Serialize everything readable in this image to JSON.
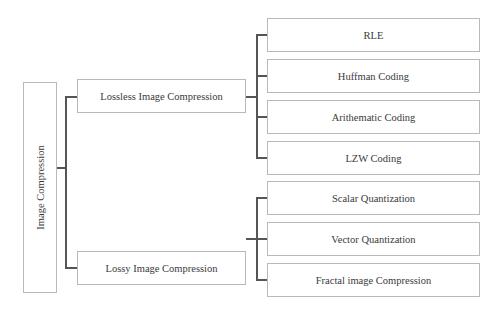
{
  "diagram": {
    "root": {
      "label": "Image Compression"
    },
    "branches": [
      {
        "label": "Lossless Image Compression",
        "children": [
          {
            "label": "RLE"
          },
          {
            "label": "Huffman Coding"
          },
          {
            "label": "Arithematic Coding"
          },
          {
            "label": "LZW Coding"
          }
        ]
      },
      {
        "label": "Lossy Image Compression",
        "children": [
          {
            "label": "Scalar Quantization"
          },
          {
            "label": "Vector Quantization"
          },
          {
            "label": "Fractal image Compression"
          }
        ]
      }
    ]
  },
  "colors": {
    "box_border": "#b9b9b9",
    "connector": "#555555",
    "text": "#3a3a3a",
    "background": "#ffffff"
  }
}
